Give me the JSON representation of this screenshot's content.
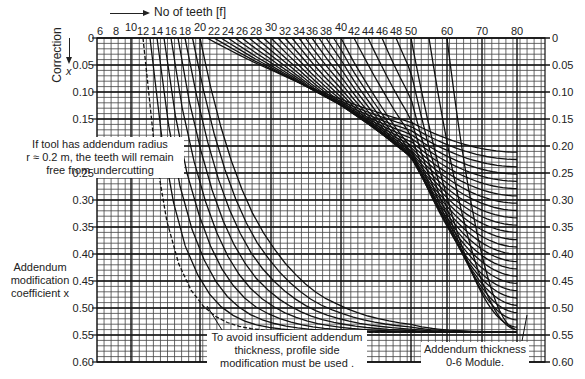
{
  "chart_data": {
    "type": "line",
    "xlabel": "No of teeth [f]",
    "ylabel": "Addendum modification coefficient x",
    "ylabel_top": "Correction",
    "ylabel_top_symbol": "x",
    "x_ticks": [
      "6",
      "8",
      "10",
      "12",
      "14",
      "16",
      "18",
      "20",
      "22",
      "24",
      "26",
      "28",
      "30",
      "32",
      "34",
      "36",
      "38",
      "40",
      "42",
      "44",
      "46",
      "48",
      "50",
      "60",
      "70",
      "80"
    ],
    "y_ticks_left": [
      "0",
      "0.05",
      "0.10",
      "0.15",
      "0.25",
      "0.30",
      "0.35",
      "0.40",
      "0.45",
      "0.50",
      "0.55",
      "0.60"
    ],
    "y_ticks_right": [
      "0",
      "0.05",
      "0.10",
      "0.15",
      "0.20",
      "0.25",
      "0.30",
      "0.35",
      "0.40",
      "0.45",
      "0.50",
      "0.55",
      "0.60"
    ],
    "ylim": [
      0,
      0.6
    ],
    "grid": true,
    "curve_starts": [
      12,
      13,
      14,
      15,
      16,
      17,
      18,
      19,
      20,
      21,
      22,
      23,
      24,
      25,
      26,
      27,
      28,
      29,
      30,
      31,
      32,
      33,
      34,
      35,
      36,
      37,
      38,
      39,
      40,
      42,
      44,
      46,
      48,
      50,
      55,
      60
    ],
    "curve_end_x_at_80": [
      0.1,
      0.15,
      0.18,
      0.21,
      0.23,
      0.25,
      0.27,
      0.29,
      0.3,
      0.33,
      0.35,
      0.37,
      0.4,
      0.42,
      0.45,
      0.47,
      0.49,
      0.52,
      0.53
    ],
    "annotations": [
      "If tool has addendum radius r ≈ 0.2 m, the teeth will remain free from undercutting",
      "To avoid insufficient addendum thickness, profile side modification must be used .",
      "Addendum thickness 0-6 Module."
    ]
  },
  "labels": {
    "x_axis_title": "No of teeth [f]",
    "correction": "Correction",
    "correction_symbol": "x",
    "y_axis_line1": "Addendum",
    "y_axis_line2": "modification",
    "y_axis_line3": "coefficient x",
    "note_undercut_1": "If tool has addendum radius",
    "note_undercut_2": "r ≈ 0.2 m, the teeth will remain",
    "note_undercut_3": "free from undercutting",
    "note_profile_1": "To avoid insufficient addendum",
    "note_profile_2": "thickness, profile side",
    "note_profile_3": "modification must be used .",
    "note_thickness_1": "Addendum thickness",
    "note_thickness_2": "0-6 Module."
  }
}
